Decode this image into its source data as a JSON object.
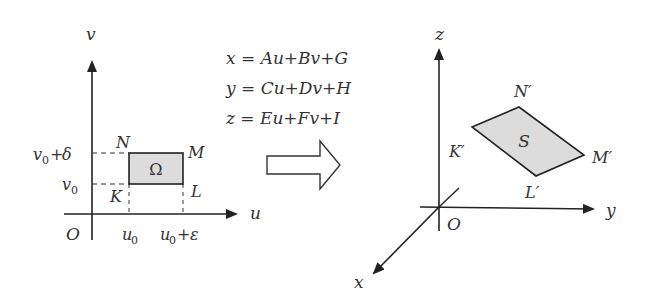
{
  "left_panel": {
    "axis_v": "v",
    "axis_u": "u",
    "origin": "O",
    "tick_v0": "v0",
    "tick_v0_delta": "v0+δ",
    "tick_u0": "u0",
    "tick_u0_eps": "u0+ε",
    "region": "Ω",
    "corners": {
      "K": "K",
      "L": "L",
      "M": "M",
      "N": "N"
    },
    "region_fill": "#dcdcdc"
  },
  "mapping": {
    "equations": [
      "x = Au+Bv+G",
      "y = Cu+Dv+H",
      "z = Eu+Fv+I"
    ],
    "arrow": "right-hollow-arrow"
  },
  "right_panel": {
    "axis_x": "x",
    "axis_y": "y",
    "axis_z": "z",
    "origin": "O",
    "surface": "S",
    "corners": {
      "K": "K′",
      "L": "L′",
      "M": "M′",
      "N": "N′"
    },
    "surface_fill": "#dcdcdc"
  }
}
